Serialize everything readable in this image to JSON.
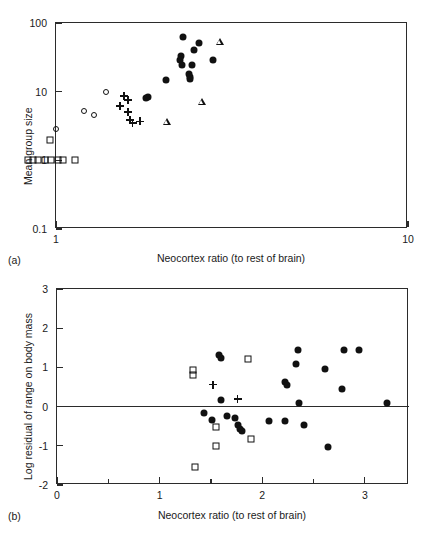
{
  "figure": {
    "panels": [
      {
        "tag": "(a)",
        "xlabel": "Neocortex ratio (to rest of brain)",
        "ylabel": "Mean group size"
      },
      {
        "tag": "(b)",
        "xlabel": "Neocortex ratio (to rest of brain)",
        "ylabel": "Log residual of range on body mass"
      }
    ]
  },
  "chart_data": [
    {
      "type": "scatter",
      "panel": "(a)",
      "title": "",
      "xlabel": "Neocortex ratio (to rest of brain)",
      "ylabel": "Mean group size",
      "xscale": "log",
      "yscale": "log",
      "xlim": [
        1,
        10
      ],
      "ylim": [
        0.1,
        100
      ],
      "xticks": [
        1,
        10
      ],
      "xticklabels": [
        "1",
        "10"
      ],
      "yticks": [
        0.1,
        1,
        10,
        100
      ],
      "yticklabels": [
        "0.1",
        "1",
        "10",
        "100"
      ],
      "grid": false,
      "legend": "none",
      "series": [
        {
          "name": "open-square",
          "marker": "open-square",
          "points": [
            [
              0.83,
              1.0
            ],
            [
              0.86,
              1.0
            ],
            [
              0.89,
              1.0
            ],
            [
              0.93,
              1.0
            ],
            [
              0.97,
              1.0
            ],
            [
              1.01,
              1.0
            ],
            [
              1.05,
              1.0
            ],
            [
              1.13,
              1.0
            ],
            [
              0.96,
              2.0
            ]
          ]
        },
        {
          "name": "open-circle",
          "marker": "open-circle",
          "points": [
            [
              1.39,
              10.0
            ],
            [
              1.2,
              5.2
            ],
            [
              1.28,
              4.6
            ],
            [
              1.0,
              2.9
            ]
          ]
        },
        {
          "name": "plus",
          "marker": "plus",
          "points": [
            [
              1.56,
              8.6
            ],
            [
              1.6,
              7.6
            ],
            [
              1.52,
              6.2
            ],
            [
              1.6,
              5.1
            ],
            [
              1.62,
              3.9
            ],
            [
              1.65,
              3.5
            ],
            [
              1.73,
              3.7
            ]
          ]
        },
        {
          "name": "filled-circle",
          "marker": "filled-circle",
          "points": [
            [
              2.3,
              63.0
            ],
            [
              2.54,
              52.0
            ],
            [
              2.46,
              41.0
            ],
            [
              2.27,
              33.0
            ],
            [
              2.25,
              29.0
            ],
            [
              2.8,
              29.0
            ],
            [
              2.28,
              24.5
            ],
            [
              2.44,
              24.5
            ],
            [
              2.38,
              18.0
            ],
            [
              2.4,
              16.5
            ],
            [
              2.41,
              15.5
            ],
            [
              2.05,
              15.0
            ],
            [
              1.83,
              8.4
            ],
            [
              1.8,
              8.2
            ]
          ]
        },
        {
          "name": "open-triangle",
          "marker": "open-triangle",
          "points": [
            [
              2.92,
              53.0
            ],
            [
              2.6,
              7.2
            ],
            [
              2.07,
              3.7
            ]
          ]
        }
      ]
    },
    {
      "type": "scatter",
      "panel": "(b)",
      "title": "",
      "xlabel": "Neocortex ratio (to rest of brain)",
      "ylabel": "Log residual of range on body mass",
      "xscale": "linear",
      "yscale": "linear",
      "xlim": [
        0,
        3.43
      ],
      "ylim": [
        -2,
        3
      ],
      "xticks": [
        0,
        1,
        2,
        3
      ],
      "xticklabels": [
        "0",
        "1",
        "2",
        "3"
      ],
      "yticks": [
        -2,
        -1,
        0,
        1,
        2,
        3
      ],
      "yticklabels": [
        "-2",
        "-1",
        "0",
        "1",
        "2",
        "3"
      ],
      "grid": false,
      "reference_line_y": 0,
      "legend": "none",
      "series": [
        {
          "name": "filled-circle",
          "marker": "filled-circle",
          "points": [
            [
              1.58,
              1.32
            ],
            [
              1.6,
              1.25
            ],
            [
              2.35,
              1.45
            ],
            [
              2.8,
              1.45
            ],
            [
              2.94,
              1.45
            ],
            [
              2.33,
              1.08
            ],
            [
              2.61,
              0.97
            ],
            [
              2.22,
              0.62
            ],
            [
              2.24,
              0.54
            ],
            [
              2.78,
              0.44
            ],
            [
              1.6,
              0.18
            ],
            [
              2.36,
              0.1
            ],
            [
              3.22,
              0.08
            ],
            [
              1.43,
              -0.17
            ],
            [
              1.51,
              -0.33
            ],
            [
              1.66,
              -0.23
            ],
            [
              1.73,
              -0.3
            ],
            [
              1.76,
              -0.47
            ],
            [
              1.78,
              -0.56
            ],
            [
              1.8,
              -0.62
            ],
            [
              2.07,
              -0.36
            ],
            [
              2.22,
              -0.36
            ],
            [
              2.41,
              -0.48
            ],
            [
              2.64,
              -1.03
            ]
          ]
        },
        {
          "name": "open-square",
          "marker": "open-square",
          "points": [
            [
              1.33,
              0.93
            ],
            [
              1.33,
              0.8
            ],
            [
              1.86,
              1.22
            ],
            [
              1.55,
              -0.52
            ],
            [
              1.89,
              -0.83
            ],
            [
              1.55,
              -1.0
            ],
            [
              1.34,
              -1.55
            ]
          ]
        },
        {
          "name": "plus",
          "marker": "plus",
          "points": [
            [
              1.52,
              0.56
            ],
            [
              1.76,
              0.19
            ]
          ]
        }
      ]
    }
  ]
}
